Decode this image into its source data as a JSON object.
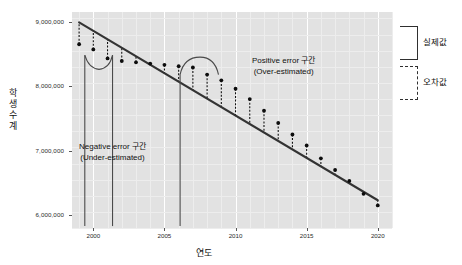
{
  "chart_data": {
    "type": "scatter",
    "title": "",
    "xlabel": "연도",
    "ylabel": "학생수계",
    "xlim": [
      1998.5,
      2021.0
    ],
    "ylim": [
      5800000,
      9150000
    ],
    "grid": true,
    "xticks": [
      "2000",
      "2005",
      "2010",
      "2015",
      "2020"
    ],
    "xtick_values": [
      2000,
      2005,
      2010,
      2015,
      2020
    ],
    "yticks": [
      "9,000,000",
      "8,000,000",
      "7,000,000",
      "6,000,000"
    ],
    "ytick_values": [
      9000000,
      8000000,
      7000000,
      6000000
    ],
    "series": [
      {
        "name": "실제값",
        "type": "scatter",
        "x": [
          1999,
          2000,
          2001,
          2002,
          2003,
          2004,
          2005,
          2006,
          2007,
          2008,
          2009,
          2010,
          2011,
          2012,
          2013,
          2014,
          2015,
          2016,
          2017,
          2018,
          2019,
          2020
        ],
        "values": [
          8650000,
          8570000,
          8430000,
          8390000,
          8370000,
          8350000,
          8330000,
          8310000,
          8290000,
          8180000,
          8090000,
          7960000,
          7800000,
          7620000,
          7430000,
          7250000,
          7080000,
          6880000,
          6700000,
          6530000,
          6330000,
          6150000
        ]
      },
      {
        "name": "추세선",
        "type": "line",
        "x": [
          1999,
          2020
        ],
        "values": [
          8990000,
          6230000
        ]
      }
    ],
    "annotations": [
      {
        "id": "positive-error",
        "line1": "Positive error 구간",
        "line2": "(Over-estimated)"
      },
      {
        "id": "negative-error",
        "line1": "Negative error 구간",
        "line2": "(Under-estimated)"
      }
    ],
    "legend": {
      "position": "right",
      "entries": [
        {
          "label": "실제값",
          "style": "solid"
        },
        {
          "label": "오차값",
          "style": "dashed"
        }
      ]
    },
    "colors": {
      "panel_background": "#e2e2e2",
      "gridline": "#ffffff",
      "trendline": "#333333",
      "point": "#0d0d0d",
      "errorbar": "#111111",
      "text": "#111111"
    }
  }
}
